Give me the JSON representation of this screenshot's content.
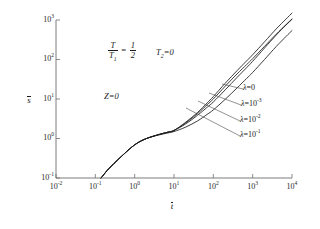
{
  "chart_data": {
    "type": "line",
    "title": "",
    "xlabel": "t̄",
    "ylabel": "s̄",
    "xscale": "log",
    "yscale": "log",
    "xlim": [
      0.01,
      10000
    ],
    "ylim": [
      0.1,
      1000
    ],
    "grid": false,
    "legend_position": "inline-right-annotations",
    "xticks": [
      {
        "value": 0.01,
        "label_mantissa": "10",
        "label_exponent": "-2"
      },
      {
        "value": 0.1,
        "label_mantissa": "10",
        "label_exponent": "-1"
      },
      {
        "value": 1,
        "label_mantissa": "10",
        "label_exponent": "0"
      },
      {
        "value": 10,
        "label_mantissa": "10",
        "label_exponent": "1"
      },
      {
        "value": 100,
        "label_mantissa": "10",
        "label_exponent": "2"
      },
      {
        "value": 1000,
        "label_mantissa": "10",
        "label_exponent": "3"
      },
      {
        "value": 10000,
        "label_mantissa": "10",
        "label_exponent": "4"
      }
    ],
    "yticks": [
      {
        "value": 0.1,
        "label_mantissa": "10",
        "label_exponent": "-1"
      },
      {
        "value": 1,
        "label_mantissa": "10",
        "label_exponent": "0"
      },
      {
        "value": 10,
        "label_mantissa": "10",
        "label_exponent": "1"
      },
      {
        "value": 100,
        "label_mantissa": "10",
        "label_exponent": "2"
      },
      {
        "value": 1000,
        "label_mantissa": "10",
        "label_exponent": "3"
      }
    ],
    "annotations": [
      {
        "name": "temperature-ratio",
        "numerator": "T",
        "denominator_base": "T",
        "denominator_sub": "1",
        "equals": "=",
        "frac_num": "1",
        "frac_den": "2"
      },
      {
        "name": "t2-condition",
        "base": "T",
        "sub": "2",
        "rest": "=0"
      },
      {
        "name": "z-condition",
        "text": "Z=0"
      }
    ],
    "series": [
      {
        "name": "lambda-0",
        "label_lambda": "λ",
        "label_eq": "=0",
        "label_exponent": "",
        "lambda_value": 0,
        "points": [
          [
            0.14,
            0.1
          ],
          [
            0.2,
            0.155
          ],
          [
            0.3,
            0.235
          ],
          [
            0.5,
            0.38
          ],
          [
            0.8,
            0.58
          ],
          [
            1.2,
            0.78
          ],
          [
            2,
            1.0
          ],
          [
            4,
            1.25
          ],
          [
            7,
            1.45
          ],
          [
            10,
            1.6
          ],
          [
            20,
            2.6
          ],
          [
            40,
            4.6
          ],
          [
            70,
            8.0
          ],
          [
            100,
            11.5
          ],
          [
            200,
            25
          ],
          [
            400,
            52
          ],
          [
            700,
            92
          ],
          [
            1000,
            132
          ],
          [
            2000,
            280
          ],
          [
            4000,
            600
          ],
          [
            7000,
            1050
          ],
          [
            10000,
            1500
          ]
        ]
      },
      {
        "name": "lambda-1e-3",
        "label_lambda": "λ",
        "label_eq": "=10",
        "label_exponent": "-3",
        "lambda_value": 0.001,
        "points": [
          [
            0.14,
            0.1
          ],
          [
            0.2,
            0.155
          ],
          [
            0.3,
            0.235
          ],
          [
            0.5,
            0.38
          ],
          [
            0.8,
            0.58
          ],
          [
            1.2,
            0.78
          ],
          [
            2,
            1.0
          ],
          [
            4,
            1.25
          ],
          [
            7,
            1.45
          ],
          [
            10,
            1.6
          ],
          [
            20,
            2.5
          ],
          [
            40,
            4.3
          ],
          [
            70,
            7.2
          ],
          [
            100,
            10.0
          ],
          [
            200,
            21
          ],
          [
            400,
            43
          ],
          [
            700,
            74
          ],
          [
            1000,
            105
          ],
          [
            2000,
            215
          ],
          [
            4000,
            440
          ],
          [
            7000,
            760
          ],
          [
            10000,
            1060
          ]
        ]
      },
      {
        "name": "lambda-1e-2",
        "label_lambda": "λ",
        "label_eq": "=10",
        "label_exponent": "-2",
        "lambda_value": 0.01,
        "points": [
          [
            0.14,
            0.1
          ],
          [
            0.2,
            0.155
          ],
          [
            0.3,
            0.235
          ],
          [
            0.5,
            0.38
          ],
          [
            0.8,
            0.58
          ],
          [
            1.2,
            0.78
          ],
          [
            2,
            1.0
          ],
          [
            4,
            1.25
          ],
          [
            7,
            1.45
          ],
          [
            10,
            1.6
          ],
          [
            20,
            2.35
          ],
          [
            40,
            3.9
          ],
          [
            70,
            6.2
          ],
          [
            100,
            8.4
          ],
          [
            200,
            17
          ],
          [
            400,
            35
          ],
          [
            700,
            62
          ],
          [
            1000,
            90
          ],
          [
            2000,
            195
          ],
          [
            4000,
            420
          ],
          [
            7000,
            740
          ],
          [
            10000,
            1040
          ]
        ]
      },
      {
        "name": "lambda-1e-1",
        "label_lambda": "λ",
        "label_eq": "=10",
        "label_exponent": "-1",
        "lambda_value": 0.1,
        "points": [
          [
            0.14,
            0.1
          ],
          [
            0.2,
            0.155
          ],
          [
            0.3,
            0.235
          ],
          [
            0.5,
            0.38
          ],
          [
            0.8,
            0.58
          ],
          [
            1.2,
            0.78
          ],
          [
            2,
            1.0
          ],
          [
            4,
            1.22
          ],
          [
            7,
            1.38
          ],
          [
            10,
            1.5
          ],
          [
            20,
            1.95
          ],
          [
            40,
            2.8
          ],
          [
            70,
            4.1
          ],
          [
            100,
            5.3
          ],
          [
            200,
            9.8
          ],
          [
            400,
            19
          ],
          [
            700,
            33
          ],
          [
            1000,
            47
          ],
          [
            2000,
            100
          ],
          [
            4000,
            215
          ],
          [
            7000,
            380
          ],
          [
            10000,
            540
          ]
        ]
      }
    ]
  },
  "colors": {
    "curve": "#1a1a1a",
    "axis": "#6e6e6e",
    "leader": "#4a4a4a",
    "background": "#ffffff"
  }
}
